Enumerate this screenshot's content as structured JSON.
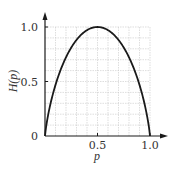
{
  "chart_data": {
    "type": "line",
    "title": "",
    "xlabel": "p",
    "ylabel": "H(p)",
    "xlim": [
      0,
      1
    ],
    "ylim": [
      0,
      1
    ],
    "grid": true,
    "grid_step": 0.1,
    "x_ticks": [
      {
        "value": 0.5,
        "label": "0.5"
      },
      {
        "value": 1.0,
        "label": "1.0"
      }
    ],
    "y_ticks": [
      {
        "value": 0,
        "label": "0"
      },
      {
        "value": 0.5,
        "label": "0.5"
      },
      {
        "value": 1.0,
        "label": "1.0"
      }
    ],
    "series": [
      {
        "name": "H(p)",
        "function": "binary_entropy",
        "x": [
          0,
          0.05,
          0.1,
          0.15,
          0.2,
          0.25,
          0.3,
          0.35,
          0.4,
          0.45,
          0.5,
          0.55,
          0.6,
          0.65,
          0.7,
          0.75,
          0.8,
          0.85,
          0.9,
          0.95,
          1.0
        ],
        "values": [
          0,
          0.286,
          0.469,
          0.61,
          0.722,
          0.811,
          0.881,
          0.934,
          0.971,
          0.993,
          1.0,
          0.993,
          0.971,
          0.934,
          0.881,
          0.811,
          0.722,
          0.61,
          0.469,
          0.286,
          0
        ]
      }
    ]
  },
  "colors": {
    "curve": "#1a1a1a",
    "axis": "#1a1a1a",
    "grid": "#c8c8c8",
    "text": "#333333"
  }
}
